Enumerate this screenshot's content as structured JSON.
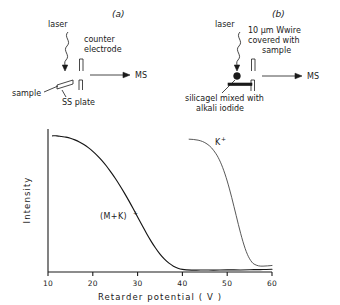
{
  "figure": {
    "panel_a": {
      "letter": "(a)",
      "labels": {
        "laser": "laser",
        "counter_electrode_line1": "counter",
        "counter_electrode_line2": "electrode",
        "ms": "MS",
        "sample": "sample",
        "plate": "SS plate"
      },
      "icons": {
        "laser_beam": "wavy-beam-icon",
        "beam_arrow": "down-arrow-icon",
        "ion_arrow": "right-arrow-icon",
        "electrode": "electrode-icon",
        "sample_plate": "slanted-plate-icon"
      }
    },
    "panel_b": {
      "letter": "(b)",
      "labels": {
        "laser": "laser",
        "wire_line1": "10 µm Wwire",
        "wire_line2": "covered with",
        "wire_line3": "sample",
        "ms": "MS",
        "matrix_line1": "silicagel  mixed with",
        "matrix_line2": "alkali    iodide"
      },
      "icons": {
        "laser_beam": "wavy-beam-icon",
        "beam_arrow": "down-arrow-icon",
        "ion_arrow": "right-arrow-icon",
        "electrode": "electrode-icon",
        "sample_dot": "sample-droplet-icon",
        "wire": "tungsten-wire-icon"
      }
    }
  },
  "chart_data": {
    "type": "line",
    "title": "",
    "xlabel": "Retarder  potential    ( V )",
    "ylabel": "Intensity",
    "xlim": [
      10,
      60
    ],
    "ylim": [
      0,
      1.05
    ],
    "xticks": [
      10,
      20,
      30,
      40,
      50,
      60
    ],
    "xticklabels": [
      "10",
      "20",
      "30",
      "40",
      "50",
      "60"
    ],
    "yticks": [],
    "yticklabels": [],
    "grid": false,
    "legend": "inline-annotations",
    "annotations": [
      {
        "text": "(M+K)",
        "sup": "+",
        "x": 27.5,
        "y": 0.37
      },
      {
        "text": "K",
        "sup": "+",
        "x": 50.0,
        "y": 0.92
      }
    ],
    "series": [
      {
        "name": "(M+K)+",
        "label": "(M+K)⁺",
        "color": "#151515",
        "x": [
          11.0,
          12.0,
          13.0,
          14.0,
          15.0,
          16.0,
          17.0,
          18.0,
          19.0,
          20.0,
          21.0,
          22.0,
          23.0,
          24.0,
          25.0,
          26.0,
          27.0,
          28.0,
          29.0,
          30.0,
          31.0,
          32.0,
          33.0,
          34.0,
          35.0,
          36.0,
          37.0,
          38.0,
          39.0,
          40.0,
          41.0,
          43.0,
          45.0,
          47.0,
          50.0,
          53.0,
          56.0,
          58.0,
          60.0
        ],
        "y": [
          1.0,
          1.0,
          0.995,
          0.99,
          0.982,
          0.97,
          0.955,
          0.936,
          0.913,
          0.886,
          0.855,
          0.82,
          0.78,
          0.735,
          0.688,
          0.637,
          0.583,
          0.526,
          0.466,
          0.404,
          0.343,
          0.283,
          0.227,
          0.176,
          0.131,
          0.094,
          0.065,
          0.043,
          0.028,
          0.019,
          0.016,
          0.014,
          0.015,
          0.014,
          0.016,
          0.015,
          0.017,
          0.018,
          0.02
        ]
      },
      {
        "name": "K+",
        "label": "K⁺",
        "color": "#3a3a3a",
        "x": [
          41.5,
          42.5,
          43.5,
          44.5,
          45.5,
          46.5,
          47.5,
          48.0,
          48.5,
          49.0,
          49.5,
          50.0,
          50.5,
          51.0,
          51.5,
          52.0,
          52.5,
          53.0,
          53.5,
          54.0,
          54.5,
          55.0,
          55.5,
          56.0,
          57.0,
          58.0,
          59.0,
          60.0
        ],
        "y": [
          0.975,
          0.973,
          0.968,
          0.958,
          0.94,
          0.912,
          0.868,
          0.84,
          0.806,
          0.766,
          0.72,
          0.668,
          0.61,
          0.548,
          0.482,
          0.415,
          0.348,
          0.284,
          0.225,
          0.173,
          0.13,
          0.097,
          0.073,
          0.058,
          0.045,
          0.043,
          0.045,
          0.048
        ]
      }
    ]
  }
}
